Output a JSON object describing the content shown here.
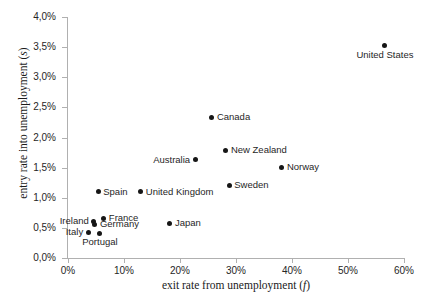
{
  "chart_data": {
    "type": "scatter",
    "title": "",
    "xlabel": "exit rate from unemployment (f)",
    "xlabel_main": "exit rate from unemployment (",
    "xlabel_italic": "f",
    "xlabel_tail": ")",
    "ylabel": "entry rate into unemployment (s)",
    "ylabel_main": "entry rate into unemployment (",
    "ylabel_italic": "s",
    "ylabel_tail": ")",
    "xlim": [
      0,
      60
    ],
    "ylim": [
      0,
      4.0
    ],
    "xunit": "%",
    "yunit": "%",
    "grid": false,
    "legend": false,
    "xticks": [
      "0%",
      "10%",
      "20%",
      "30%",
      "40%",
      "50%",
      "60%"
    ],
    "xtick_values": [
      0,
      10,
      20,
      30,
      40,
      50,
      60
    ],
    "yticks": [
      "0,0%",
      "0,5%",
      "1,0%",
      "1,5%",
      "2,0%",
      "2,5%",
      "3,0%",
      "3,5%",
      "4,0%"
    ],
    "ytick_values": [
      0.0,
      0.5,
      1.0,
      1.5,
      2.0,
      2.5,
      3.0,
      3.5,
      4.0
    ],
    "marker_color": "#161616",
    "axis_color": "#b0b0b0",
    "points": [
      {
        "label": "United States",
        "x": 56.6,
        "y": 3.52,
        "label_pos": "below"
      },
      {
        "label": "Canada",
        "x": 25.7,
        "y": 2.34,
        "label_pos": "right"
      },
      {
        "label": "New Zealand",
        "x": 28.2,
        "y": 1.79,
        "label_pos": "right"
      },
      {
        "label": "Norway",
        "x": 38.2,
        "y": 1.51,
        "label_pos": "right"
      },
      {
        "label": "Australia",
        "x": 22.7,
        "y": 1.63,
        "label_pos": "left"
      },
      {
        "label": "Sweden",
        "x": 28.8,
        "y": 1.21,
        "label_pos": "right"
      },
      {
        "label": "Spain",
        "x": 5.4,
        "y": 1.1,
        "label_pos": "right"
      },
      {
        "label": "United Kingdom",
        "x": 13.0,
        "y": 1.1,
        "label_pos": "right"
      },
      {
        "label": "France",
        "x": 6.4,
        "y": 0.66,
        "label_pos": "right"
      },
      {
        "label": "Ireland",
        "x": 4.6,
        "y": 0.61,
        "label_pos": "left"
      },
      {
        "label": "Germany",
        "x": 4.8,
        "y": 0.56,
        "label_pos": "right"
      },
      {
        "label": "Japan",
        "x": 18.2,
        "y": 0.58,
        "label_pos": "right"
      },
      {
        "label": "Italy",
        "x": 3.6,
        "y": 0.43,
        "label_pos": "left"
      },
      {
        "label": "Portugal",
        "x": 5.7,
        "y": 0.41,
        "label_pos": "below"
      }
    ]
  }
}
